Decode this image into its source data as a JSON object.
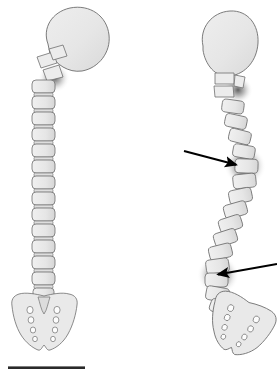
{
  "figure": {
    "background_color": "#ffffff",
    "width": 277,
    "height": 377,
    "caption_text": "",
    "bone_fill_color": "#e9e9e9",
    "bone_outline_color": "#6d6d6d",
    "shadow_color": "#3b3b3b",
    "arrow_color": "#000000",
    "scale_bar_color": "#2a2a2a"
  },
  "specimens": [
    {
      "id": "left-specimen",
      "name": "normal-spine",
      "label": "",
      "description": "Straight vertebral column in lateral view with cranium, cervical, thoracic and lumbar vertebrae and sacrum",
      "curvature": "straight",
      "vertebra_count": 24,
      "skull": {
        "name": "cranium",
        "center_x": 72,
        "center_y": 40,
        "radius_x": 34,
        "radius_y": 32,
        "rotation_deg": -18
      },
      "sacrum": {
        "name": "sacrum",
        "center_x": 44,
        "center_y": 315,
        "foramina_rows": 4,
        "foramina_per_row": 2,
        "rotation_deg": 0
      },
      "shadow_markers": [
        {
          "name": "cervical-shadow",
          "x": 54,
          "y": 78,
          "radius": 14,
          "intensity": 0.55
        }
      ]
    },
    {
      "id": "right-specimen",
      "name": "scoliotic-spine",
      "label": "",
      "description": "Deformed S-curved vertebral column in lateral view with cranium, wedged vertebrae and rotated sacrum",
      "curvature": "s-shaped",
      "vertebra_count": 24,
      "skull": {
        "name": "cranium",
        "center_x": 228,
        "center_y": 43,
        "radius_x": 28,
        "radius_y": 30,
        "rotation_deg": -8
      },
      "sacrum": {
        "name": "sacrum",
        "center_x": 238,
        "center_y": 325,
        "foramina_rows": 4,
        "foramina_per_row": 2,
        "rotation_deg": 28
      },
      "shadow_markers": [
        {
          "name": "cervical-shadow",
          "x": 238,
          "y": 90,
          "radius": 13,
          "intensity": 0.6
        },
        {
          "name": "upper-lesion-shadow",
          "x": 245,
          "y": 166,
          "radius": 19,
          "intensity": 0.85
        },
        {
          "name": "lower-lesion-shadow",
          "x": 218,
          "y": 275,
          "radius": 19,
          "intensity": 0.85
        }
      ]
    }
  ],
  "annotations": {
    "arrows": [
      {
        "name": "upper-deformity-arrow",
        "label": "",
        "points_to": "upper-lesion-shadow",
        "tail_x": 184,
        "tail_y": 151,
        "tip_x": 245,
        "tip_y": 167,
        "direction": "down-right"
      },
      {
        "name": "lower-deformity-arrow",
        "label": "",
        "points_to": "lower-lesion-shadow",
        "tail_x": 277,
        "tail_y": 264,
        "tip_x": 209,
        "tip_y": 276,
        "direction": "down-left"
      }
    ]
  },
  "scale_bar": {
    "name": "scale-bar",
    "label": "",
    "x": 8,
    "y": 369,
    "length_px": 77,
    "thickness_px": 2.6
  }
}
